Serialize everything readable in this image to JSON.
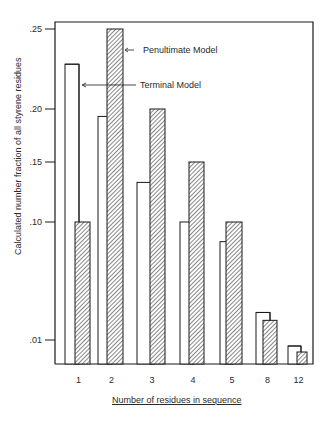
{
  "chart_data": {
    "type": "bar",
    "title": "",
    "xlabel": "Number of residues in sequence",
    "ylabel": "Calculated number fraction of all styrene residues",
    "categories": [
      "1",
      "2",
      "3",
      "4",
      "5",
      "8",
      "12"
    ],
    "series": [
      {
        "name": "Terminal Model",
        "style": "open",
        "values": [
          0.228,
          0.193,
          0.133,
          0.1,
          0.085,
          0.031,
          0.0075
        ]
      },
      {
        "name": "Penultimate Model",
        "style": "hatched",
        "values": [
          0.1,
          0.25,
          0.2,
          0.15,
          0.1,
          0.025,
          0.005
        ]
      }
    ],
    "yticks": [
      ".01",
      ".10",
      ".15",
      ".20",
      ".25"
    ],
    "ytick_values": [
      0.01,
      0.1,
      0.15,
      0.2,
      0.25
    ],
    "y_scale_note": "non-linear (compressed below .10)",
    "ylim": [
      0,
      0.26
    ],
    "grid": false,
    "legend": {
      "position": "top-center, arrow annotations",
      "entries": [
        "Penultimate Model",
        "Terminal Model"
      ]
    }
  },
  "colors": {
    "ink": "#1a1a1a",
    "hatch": "#555555",
    "background": "#ffffff"
  }
}
